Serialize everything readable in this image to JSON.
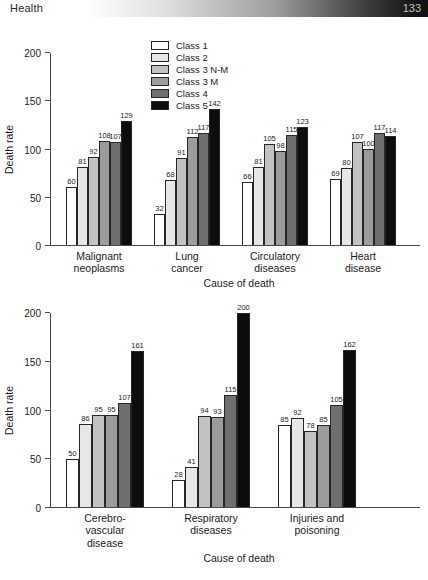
{
  "header": {
    "section_title": "Health",
    "page_number": "133"
  },
  "legend": {
    "position": "top-left-inside-plot",
    "items": [
      {
        "label": "Class 1",
        "color": "#ffffff"
      },
      {
        "label": "Class 2",
        "color": "#e7e7e7"
      },
      {
        "label": "Class 3 N-M",
        "color": "#c2c2c2"
      },
      {
        "label": "Class 3 M",
        "color": "#9c9c9c"
      },
      {
        "label": "Class 4",
        "color": "#6f6f6f"
      },
      {
        "label": "Class 5",
        "color": "#0d0d0d"
      }
    ]
  },
  "chart_data": [
    {
      "type": "bar",
      "title": "",
      "xlabel": "Cause of death",
      "ylabel": "Death rate",
      "ylim": [
        0,
        200
      ],
      "yticks": [
        0,
        50,
        100,
        150,
        200
      ],
      "grid": false,
      "categories": [
        "Malignant neoplasms",
        "Lung cancer",
        "Circulatory diseases",
        "Heart disease"
      ],
      "category_labels": [
        "Malignant\nneoplasms",
        "Lung\ncancer",
        "Circulatory\ndiseases",
        "Heart\ndisease"
      ],
      "series": [
        {
          "name": "Class 1",
          "values": [
            60,
            32,
            66,
            69
          ]
        },
        {
          "name": "Class 2",
          "values": [
            81,
            68,
            81,
            80
          ]
        },
        {
          "name": "Class 3 N-M",
          "values": [
            92,
            91,
            105,
            107
          ]
        },
        {
          "name": "Class 3 M",
          "values": [
            108,
            112,
            98,
            100
          ]
        },
        {
          "name": "Class 4",
          "values": [
            107,
            117,
            115,
            117
          ]
        },
        {
          "name": "Class 5",
          "values": [
            129,
            142,
            123,
            114
          ]
        }
      ]
    },
    {
      "type": "bar",
      "title": "",
      "xlabel": "Cause of death",
      "ylabel": "Death rate",
      "ylim": [
        0,
        200
      ],
      "yticks": [
        0,
        50,
        100,
        150,
        200
      ],
      "grid": false,
      "categories": [
        "Cerebro-vascular disease",
        "Respiratory diseases",
        "Injuries and poisoning"
      ],
      "category_labels": [
        "Cerebro-\nvascular\ndisease",
        "Respiratory\ndiseases",
        "Injuries and\npoisoning"
      ],
      "series": [
        {
          "name": "Class 1",
          "values": [
            50,
            28,
            85
          ]
        },
        {
          "name": "Class 2",
          "values": [
            86,
            41,
            92
          ]
        },
        {
          "name": "Class 3 N-M",
          "values": [
            95,
            94,
            78
          ]
        },
        {
          "name": "Class 3 M",
          "values": [
            95,
            93,
            85
          ]
        },
        {
          "name": "Class 4",
          "values": [
            107,
            115,
            105
          ]
        },
        {
          "name": "Class 5",
          "values": [
            161,
            200,
            162
          ]
        }
      ]
    }
  ]
}
